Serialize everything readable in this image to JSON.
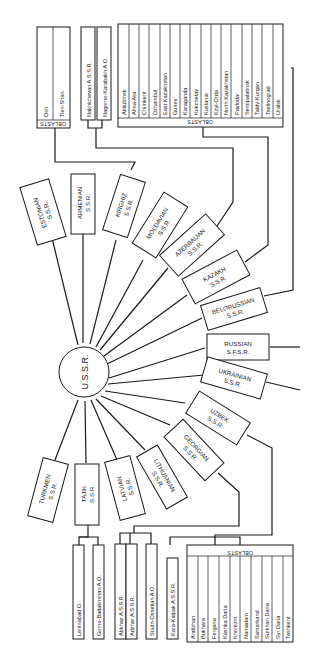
{
  "diagram": {
    "title": "U.S.S.R.",
    "republics": [
      {
        "name": "ESTONIAN",
        "suffix": "S.S.R."
      },
      {
        "name": "ARMENIAN",
        "suffix": "S.S.R."
      },
      {
        "name": "KIRGHIZ",
        "suffix": "S.S.R."
      },
      {
        "name": "MOLDAVIAN",
        "suffix": "S.S.R."
      },
      {
        "name": "AZERBAIJAN",
        "suffix": "S.S.R."
      },
      {
        "name": "KAZAKH",
        "suffix": "S.S.R."
      },
      {
        "name": "BELORUSSIAN",
        "suffix": "S.S.R."
      },
      {
        "name": "RUSSIAN",
        "suffix": "S.F.S.R."
      },
      {
        "name": "UKRAINIAN",
        "suffix": "S.S.R."
      },
      {
        "name": "UZBEK",
        "suffix": "S.S.R."
      },
      {
        "name": "GEORGIAN",
        "suffix": "S.S.R."
      },
      {
        "name": "LITHUANIAN",
        "suffix": "S.S.R."
      },
      {
        "name": "LATVIAN",
        "suffix": "S.S.R."
      },
      {
        "name": "TAJIK",
        "suffix": "S.S.R."
      },
      {
        "name": "TURKMEN",
        "suffix": "S.S.R."
      }
    ],
    "kirghiz_oblasts": {
      "header": "OBLASTS",
      "items": [
        "Osh",
        "Tien-Shan"
      ]
    },
    "azerbaijan_subdivisions": [
      "Nakhichevan A.S.S.R.",
      "Nagorno-Karabakh A.O."
    ],
    "kazakh_oblasts": {
      "header": "OBLASTS",
      "items": [
        "Aktiubinsk",
        "Alma-Ata",
        "Chimkent",
        "Dzhambul",
        "East Kazakhstan",
        "Guriev",
        "Karaganda",
        "Kokchetav",
        "Kustanai",
        "Kzyl-Orda",
        "North Kazakhstan",
        "Pavlodar",
        "Semipalatinsk",
        "Taldy-Kurgan",
        "Tselinograd",
        "Uralsk"
      ]
    },
    "tajik_subdivisions": [
      "Leninabad O.",
      "Gorno-Badakhshan A.O."
    ],
    "georgian_subdivisions": [
      "Abkhaz A.S.S.R.",
      "Adzhar A.S.S.R.",
      "South-Ossetian A.O."
    ],
    "uzbek_subdivisions": [
      "Kara-Kalpak A.S.S.R."
    ],
    "uzbek_oblasts": {
      "header": "OBLASTS",
      "items": [
        "Andizhan",
        "Bukhara",
        "Fergana",
        "Kashka Daria",
        "Khorezm",
        "Namadam",
        "Samarkand",
        "Surkhan Daria",
        "Syr Daria",
        "Tashkent"
      ]
    }
  }
}
